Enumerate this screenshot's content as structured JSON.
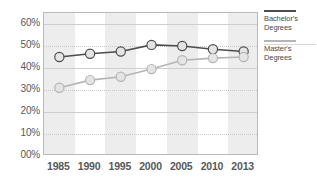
{
  "chart_data": {
    "type": "line",
    "title": "",
    "subtitle": "",
    "xlabel": "",
    "ylabel": "",
    "categories": [
      "1985",
      "1990",
      "1995",
      "2000",
      "2005",
      "2010",
      "2013"
    ],
    "ylim": [
      0,
      65
    ],
    "yticks": [
      0,
      10,
      20,
      30,
      40,
      50,
      60
    ],
    "ytick_labels": [
      "00%",
      "10%",
      "20%",
      "30%",
      "40%",
      "50%",
      "60%"
    ],
    "grid": true,
    "legend_position": "right",
    "series": [
      {
        "name": "Bachelor's Degrees",
        "color": "#4d4d4f",
        "marker_fill": "#e4e4e5",
        "values": [
          45,
          46.5,
          47.5,
          50.5,
          50,
          48.5,
          47.5
        ]
      },
      {
        "name": "Master's Degrees",
        "color": "#b5b5b7",
        "marker_fill": "#e4e4e5",
        "values": [
          31,
          34.5,
          36,
          39.5,
          43.5,
          44.5,
          45
        ]
      }
    ]
  },
  "legend": {
    "items": [
      {
        "label_line1": "Bachelor's",
        "label_line2": "Degrees",
        "color": "#4d4d4f"
      },
      {
        "label_line1": "Master's",
        "label_line2": "Degrees",
        "color": "#b5b5b7"
      }
    ]
  },
  "colors": {
    "band": "#ededee",
    "gridline": "#cfcfd1",
    "frame": "#b9b9bb",
    "axis_text": "#58585a",
    "background": "#ffffff"
  }
}
